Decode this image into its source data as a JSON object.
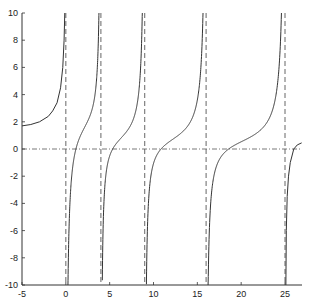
{
  "chart_data": {
    "type": "line",
    "title": "",
    "xlabel": "",
    "ylabel": "",
    "xlim": [
      -5,
      27
    ],
    "ylim": [
      -10,
      10
    ],
    "grid": false,
    "legend": null,
    "x_ticks": [
      -5,
      0,
      5,
      10,
      15,
      20,
      25
    ],
    "y_ticks": [
      -10,
      -8,
      -6,
      -4,
      -2,
      0,
      2,
      4,
      6,
      8,
      10
    ],
    "reference_lines": {
      "horizontal_dashdot_y": 0,
      "vertical_dashed_asymptotes_x": [
        0,
        4,
        9,
        16,
        25
      ]
    },
    "series": [
      {
        "name": "f(x)",
        "color": "#333333",
        "branches": [
          {
            "x_range": [
              -5,
              0
            ],
            "points": [
              [
                -5,
                1.7
              ],
              [
                -4,
                1.8
              ],
              [
                -3,
                2.0
              ],
              [
                -2,
                2.4
              ],
              [
                -1.5,
                2.8
              ],
              [
                -1,
                3.4
              ],
              [
                -0.6,
                4.5
              ],
              [
                -0.35,
                6.0
              ],
              [
                -0.2,
                8.0
              ],
              [
                -0.12,
                10.0
              ]
            ]
          },
          {
            "x_range": [
              0,
              4
            ],
            "zero_crossing": 1.15,
            "asymptote_form": {
              "A": 0.5,
              "B": 0.76,
              "C": 1.94
            }
          },
          {
            "x_range": [
              4,
              9
            ],
            "zero_crossing": 4.8,
            "asymptote_form": {
              "A": 0.55,
              "B": 0.35,
              "C": 0.55
            }
          },
          {
            "x_range": [
              9,
              16
            ],
            "zero_crossing": 10.0,
            "asymptote_form": {
              "A": 0.5,
              "B": 0.3,
              "C": 0.45
            }
          },
          {
            "x_range": [
              16,
              25
            ],
            "zero_crossing": 17.0,
            "asymptote_form": {
              "A": 0.45,
              "B": 0.28,
              "C": 0.35
            }
          },
          {
            "x_range": [
              25,
              26.9
            ],
            "points": [
              [
                25.1,
                -10
              ],
              [
                25.15,
                -6
              ],
              [
                25.25,
                -3.5
              ],
              [
                25.4,
                -2
              ],
              [
                25.6,
                -1
              ],
              [
                26.0,
                0
              ],
              [
                26.4,
                0.3
              ],
              [
                26.9,
                0.45
              ]
            ]
          }
        ]
      }
    ]
  }
}
